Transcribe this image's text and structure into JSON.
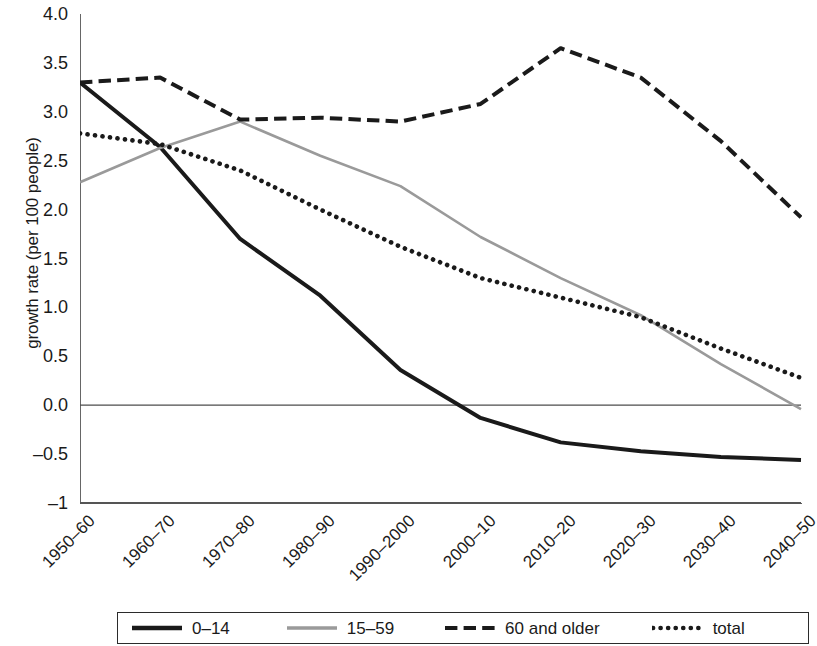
{
  "chart_data": {
    "type": "line",
    "title": "",
    "xlabel": "",
    "ylabel": "growth rate (per 100 people)",
    "categories": [
      "1950–60",
      "1960–70",
      "1970–80",
      "1980–90",
      "1990–2000",
      "2000–10",
      "2010–20",
      "2020–30",
      "2030–40",
      "2040–50"
    ],
    "ylim": [
      -1,
      4.0
    ],
    "yticks": [
      4.0,
      3.5,
      3.0,
      2.5,
      2.0,
      1.5,
      1.0,
      0.5,
      0.0,
      -0.5,
      -1
    ],
    "ytick_labels": [
      "4.0",
      "3.5",
      "3.0",
      "2.5",
      "2.0",
      "1.5",
      "1.0",
      "0.5",
      "0.0",
      "–0.5",
      "–1"
    ],
    "grid": false,
    "zero_line": true,
    "legend_position": "bottom",
    "series": [
      {
        "name": "0–14",
        "style": "solid",
        "color": "#1a1a1a",
        "width": 4,
        "values": [
          3.3,
          2.64,
          1.7,
          1.12,
          0.36,
          -0.13,
          -0.38,
          -0.47,
          -0.53,
          -0.56
        ]
      },
      {
        "name": "15–59",
        "style": "solid",
        "color": "#9a9a9a",
        "width": 2.6,
        "values": [
          2.28,
          2.63,
          2.9,
          2.55,
          2.24,
          1.72,
          1.3,
          0.92,
          0.42,
          -0.04
        ]
      },
      {
        "name": "60 and older",
        "style": "dashed",
        "color": "#1a1a1a",
        "width": 4,
        "values": [
          3.3,
          3.35,
          2.92,
          2.94,
          2.9,
          3.08,
          3.65,
          3.35,
          2.7,
          1.92
        ]
      },
      {
        "name": "total",
        "style": "dotted",
        "color": "#1a1a1a",
        "width": 4.6,
        "values": [
          2.78,
          2.67,
          2.4,
          2.0,
          1.62,
          1.3,
          1.1,
          0.9,
          0.58,
          0.28
        ]
      }
    ]
  },
  "legend": {
    "items": [
      {
        "label": "0–14",
        "swatch": "solid-black-line-swatch"
      },
      {
        "label": "15–59",
        "swatch": "solid-gray-line-swatch"
      },
      {
        "label": "60 and older",
        "swatch": "dashed-black-line-swatch"
      },
      {
        "label": "total",
        "swatch": "dotted-black-line-swatch"
      }
    ]
  }
}
